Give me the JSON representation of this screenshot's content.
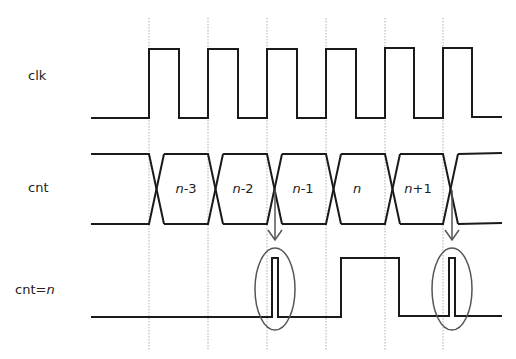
{
  "diagram": {
    "type": "timing-diagram",
    "colors": {
      "waveform": "#1a1a1a",
      "gridline": "#999999",
      "annotation": "#555555",
      "text": "#222222"
    },
    "signals": [
      {
        "id": "clk",
        "label": "clk",
        "label_plain": "clk",
        "label_italic": ""
      },
      {
        "id": "cnt",
        "label": "cnt",
        "label_plain": "cnt",
        "label_italic": ""
      },
      {
        "id": "cnt_eq_n",
        "label": "cnt=n",
        "label_plain": "cnt=",
        "label_italic": "n"
      }
    ],
    "clock_edges_x": [
      149,
      208,
      267,
      326,
      385,
      443
    ],
    "cnt_states": [
      {
        "prefix": "n",
        "suffix": "-3",
        "label": "n-3"
      },
      {
        "prefix": "n",
        "suffix": "-2",
        "label": "n-2"
      },
      {
        "prefix": "n",
        "suffix": "-1",
        "label": "n-1"
      },
      {
        "prefix": "n",
        "suffix": "",
        "label": "n"
      },
      {
        "prefix": "n",
        "suffix": "+1",
        "label": "n+1"
      }
    ],
    "annotations": [
      {
        "type": "glitch-highlight",
        "description": "glitch on cnt=n during cnt transition n-2 to n-1"
      },
      {
        "type": "glitch-highlight",
        "description": "glitch on cnt=n during cnt transition n+1 to next"
      }
    ]
  }
}
